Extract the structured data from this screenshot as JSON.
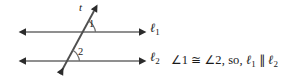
{
  "figure": {
    "type": "geometry-diagram",
    "topic": "parallel lines cut by a transversal",
    "background_color": "#ffffff",
    "line_color": "#8a8a8a",
    "transversal_color": "#4a4a4a",
    "arc_color": "#6e6e6e",
    "text_color": "#1a1a1a"
  },
  "labels": {
    "transversal": "t",
    "line1": "ℓ",
    "line1_subscript": "1",
    "line2": "ℓ",
    "line2_subscript": "2",
    "angle1": "1",
    "angle2": "2"
  },
  "statement": {
    "angle_symbol": "∠",
    "angle1_number": "1",
    "congruent_symbol": "≅",
    "angle2_number": "2",
    "connector": ", so, ",
    "line1": "ℓ",
    "line1_subscript": "1",
    "parallel_symbol": "∥",
    "line2": "ℓ",
    "line2_subscript": "2",
    "full_text": "∠1 ≅ ∠2, so, ℓ₁ ∥ ℓ₂"
  },
  "geometry": {
    "line1_y": 32,
    "line2_y": 61,
    "line_x_start": 18,
    "line_x_end": 146,
    "transversal_top": [
      97,
      6
    ],
    "transversal_bottom": [
      56,
      79
    ],
    "intersection1": [
      80,
      32
    ],
    "intersection2": [
      64,
      61
    ]
  }
}
